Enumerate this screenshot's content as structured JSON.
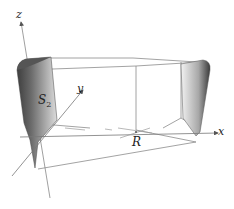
{
  "diagram": {
    "type": "3d-surface-illustration",
    "axes": {
      "z_label": "z",
      "y_label": "y",
      "x_label": "x"
    },
    "labels": {
      "origin": "R",
      "surface_name": "S",
      "surface_subscript": "2"
    },
    "colors": {
      "axis": "#777777",
      "frame": "#888888",
      "surface_dark": "#4a4a4a",
      "surface_light": "#e6e6e6",
      "text": "#222222"
    }
  }
}
